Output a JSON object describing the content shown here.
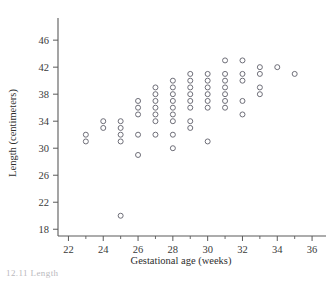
{
  "figure": {
    "background_color": "#ffffff",
    "point_color": "#6e6e78",
    "axis_color": "#5a5a5a",
    "caption_fragment": "12.11 Length"
  },
  "chart_data": {
    "type": "scatter",
    "title": "",
    "xlabel": "Gestational age (weeks)",
    "ylabel": "Length (centimeters)",
    "xlim": [
      21.4,
      36.8
    ],
    "ylim": [
      17.0,
      47.8
    ],
    "xticks": [
      22,
      24,
      26,
      28,
      30,
      32,
      34,
      36
    ],
    "xtick_labels": [
      "22",
      "24",
      "26",
      "28",
      "30",
      "32",
      "34",
      "36"
    ],
    "xminor_ticks": [
      23,
      25,
      27,
      29,
      31,
      33,
      35
    ],
    "yticks": [
      18,
      22,
      26,
      30,
      34,
      38,
      42,
      46
    ],
    "ytick_labels": [
      "18",
      "22",
      "26",
      "30",
      "34",
      "38",
      "42",
      "46"
    ],
    "grid": false,
    "legend": false,
    "marker": "open-circle",
    "points": [
      {
        "x": 23,
        "y": 32
      },
      {
        "x": 23,
        "y": 31
      },
      {
        "x": 24,
        "y": 34
      },
      {
        "x": 24,
        "y": 33
      },
      {
        "x": 25,
        "y": 34
      },
      {
        "x": 25,
        "y": 33
      },
      {
        "x": 25,
        "y": 32
      },
      {
        "x": 25,
        "y": 31
      },
      {
        "x": 25,
        "y": 20
      },
      {
        "x": 26,
        "y": 37
      },
      {
        "x": 26,
        "y": 36
      },
      {
        "x": 26,
        "y": 35
      },
      {
        "x": 26,
        "y": 32
      },
      {
        "x": 26,
        "y": 29
      },
      {
        "x": 27,
        "y": 39
      },
      {
        "x": 27,
        "y": 38
      },
      {
        "x": 27,
        "y": 37
      },
      {
        "x": 27,
        "y": 36
      },
      {
        "x": 27,
        "y": 35
      },
      {
        "x": 27,
        "y": 34
      },
      {
        "x": 27,
        "y": 32
      },
      {
        "x": 28,
        "y": 40
      },
      {
        "x": 28,
        "y": 39
      },
      {
        "x": 28,
        "y": 38
      },
      {
        "x": 28,
        "y": 37
      },
      {
        "x": 28,
        "y": 36
      },
      {
        "x": 28,
        "y": 35
      },
      {
        "x": 28,
        "y": 34
      },
      {
        "x": 28,
        "y": 32
      },
      {
        "x": 28,
        "y": 30
      },
      {
        "x": 29,
        "y": 41
      },
      {
        "x": 29,
        "y": 40
      },
      {
        "x": 29,
        "y": 39
      },
      {
        "x": 29,
        "y": 38
      },
      {
        "x": 29,
        "y": 37
      },
      {
        "x": 29,
        "y": 36
      },
      {
        "x": 29,
        "y": 34
      },
      {
        "x": 29,
        "y": 33
      },
      {
        "x": 30,
        "y": 41
      },
      {
        "x": 30,
        "y": 40
      },
      {
        "x": 30,
        "y": 39
      },
      {
        "x": 30,
        "y": 38
      },
      {
        "x": 30,
        "y": 37
      },
      {
        "x": 30,
        "y": 36
      },
      {
        "x": 30,
        "y": 31
      },
      {
        "x": 31,
        "y": 43
      },
      {
        "x": 31,
        "y": 41
      },
      {
        "x": 31,
        "y": 40
      },
      {
        "x": 31,
        "y": 39
      },
      {
        "x": 31,
        "y": 38
      },
      {
        "x": 31,
        "y": 37
      },
      {
        "x": 31,
        "y": 36
      },
      {
        "x": 32,
        "y": 43
      },
      {
        "x": 32,
        "y": 41
      },
      {
        "x": 32,
        "y": 40
      },
      {
        "x": 32,
        "y": 37
      },
      {
        "x": 32,
        "y": 35
      },
      {
        "x": 33,
        "y": 42
      },
      {
        "x": 33,
        "y": 41
      },
      {
        "x": 33,
        "y": 39
      },
      {
        "x": 33,
        "y": 38
      },
      {
        "x": 34,
        "y": 42
      },
      {
        "x": 35,
        "y": 41
      }
    ]
  }
}
